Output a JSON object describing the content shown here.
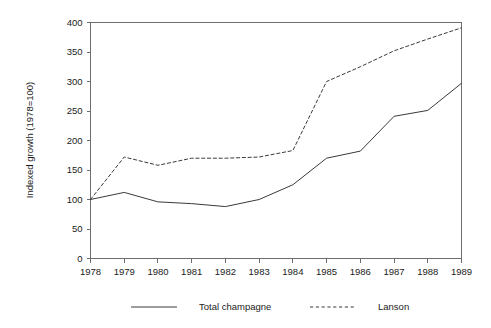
{
  "chart_data": {
    "type": "line",
    "title": "",
    "subtitle": "",
    "xlabel": "",
    "ylabel": "Indexed growth (1978=100)",
    "x": [
      1978,
      1979,
      1980,
      1981,
      1982,
      1983,
      1984,
      1985,
      1986,
      1987,
      1988,
      1989
    ],
    "categories": [
      "1978",
      "1979",
      "1980",
      "1981",
      "1982",
      "1983",
      "1984",
      "1985",
      "1986",
      "1987",
      "1988",
      "1989"
    ],
    "series": [
      {
        "name": "Total champagne",
        "style": "solid",
        "color": "#3a3a3a",
        "values": [
          100,
          112,
          96,
          93,
          88,
          100,
          125,
          170,
          182,
          241,
          251,
          297
        ]
      },
      {
        "name": "Lanson",
        "style": "dashed",
        "color": "#3a3a3a",
        "values": [
          100,
          172,
          158,
          170,
          170,
          172,
          183,
          300,
          325,
          352,
          372,
          391
        ]
      }
    ],
    "xlim": [
      1978,
      1989
    ],
    "ylim": [
      0,
      400
    ],
    "yticks": [
      0,
      50,
      100,
      150,
      200,
      250,
      300,
      350,
      400
    ],
    "ytick_labels": [
      "0",
      "50",
      "100",
      "150",
      "200",
      "250",
      "300",
      "350",
      "400"
    ],
    "xticks": [
      1978,
      1979,
      1980,
      1981,
      1982,
      1983,
      1984,
      1985,
      1986,
      1987,
      1988,
      1989
    ],
    "xtick_labels": [
      "1978",
      "1979",
      "1980",
      "1981",
      "1982",
      "1983",
      "1984",
      "1985",
      "1986",
      "1987",
      "1988",
      "1989"
    ],
    "grid": false,
    "legend_position": "below",
    "legend_entries": [
      {
        "label": "Total champagne",
        "style": "solid"
      },
      {
        "label": "Lanson",
        "style": "dashed"
      }
    ],
    "axis_color": "#6e6e6e",
    "background_color": "#ffffff"
  }
}
